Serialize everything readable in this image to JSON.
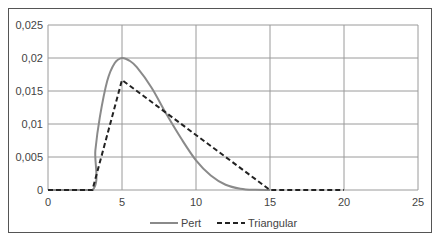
{
  "chart_data": {
    "type": "line",
    "title": "",
    "xlabel": "",
    "ylabel": "",
    "xlim": [
      0,
      25
    ],
    "ylim": [
      0,
      0.025
    ],
    "x_ticks": [
      "0",
      "5",
      "10",
      "15",
      "20",
      "25"
    ],
    "y_ticks": [
      "0",
      "0,005",
      "0,01",
      "0,015",
      "0,02",
      "0,025"
    ],
    "grid": true,
    "legend_position": "bottom",
    "series": [
      {
        "name": "Pert",
        "style": "solid",
        "color": "#888888",
        "x": [
          0,
          3,
          3.2,
          3.5,
          4,
          4.5,
          5,
          5.5,
          6,
          7,
          8,
          9,
          10,
          11,
          12,
          13,
          14,
          15
        ],
        "y": [
          0,
          0,
          0.006,
          0.011,
          0.0165,
          0.0192,
          0.02,
          0.0196,
          0.0186,
          0.0155,
          0.0115,
          0.0078,
          0.0045,
          0.0022,
          0.0008,
          0.0002,
          2e-05,
          0
        ]
      },
      {
        "name": "Triangular",
        "style": "dashed",
        "color": "#222222",
        "x": [
          0,
          3,
          5,
          15,
          20
        ],
        "y": [
          0,
          0,
          0.01667,
          0,
          0
        ]
      }
    ]
  },
  "legend": {
    "pert_label": "Pert",
    "triangular_label": "Triangular"
  },
  "axis": {
    "x_ticks": [
      "0",
      "5",
      "10",
      "15",
      "20",
      "25"
    ],
    "y_ticks": [
      "0",
      "0,005",
      "0,01",
      "0,015",
      "0,02",
      "0,025"
    ]
  }
}
